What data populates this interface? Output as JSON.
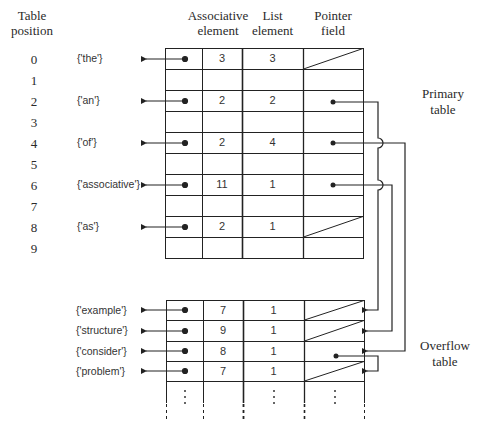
{
  "headers": {
    "table_position": [
      "Table",
      "position"
    ],
    "associative_element": [
      "Associative",
      "element"
    ],
    "list_element": [
      "List",
      "element"
    ],
    "pointer_field": [
      "Pointer",
      "field"
    ]
  },
  "labels": {
    "primary_table": [
      "Primary",
      "table"
    ],
    "overflow_table": [
      "Overflow",
      "table"
    ]
  },
  "primary_table": {
    "rows": [
      {
        "position": "0",
        "set": "{'the'}",
        "associative": "3",
        "list": "3",
        "pointer": "null"
      },
      {
        "position": "1",
        "set": "",
        "associative": "",
        "list": "",
        "pointer": ""
      },
      {
        "position": "2",
        "set": "{'an'}",
        "associative": "2",
        "list": "2",
        "pointer": "overflow-0"
      },
      {
        "position": "3",
        "set": "",
        "associative": "",
        "list": "",
        "pointer": ""
      },
      {
        "position": "4",
        "set": "{'of'}",
        "associative": "2",
        "list": "4",
        "pointer": "overflow-2"
      },
      {
        "position": "5",
        "set": "",
        "associative": "",
        "list": "",
        "pointer": ""
      },
      {
        "position": "6",
        "set": "{'associative'}",
        "associative": "11",
        "list": "1",
        "pointer": "overflow-1"
      },
      {
        "position": "7",
        "set": "",
        "associative": "",
        "list": "",
        "pointer": ""
      },
      {
        "position": "8",
        "set": "{'as'}",
        "associative": "2",
        "list": "1",
        "pointer": "null"
      },
      {
        "position": "9",
        "set": "",
        "associative": "",
        "list": "",
        "pointer": ""
      }
    ]
  },
  "overflow_table": {
    "rows": [
      {
        "set": "{'example'}",
        "associative": "7",
        "list": "1",
        "pointer": "null"
      },
      {
        "set": "{'structure'}",
        "associative": "9",
        "list": "1",
        "pointer": "null"
      },
      {
        "set": "{'consider'}",
        "associative": "8",
        "list": "1",
        "pointer": "overflow-3"
      },
      {
        "set": "{'problem'}",
        "associative": "7",
        "list": "1",
        "pointer": "null"
      }
    ],
    "continuation": "⋮"
  },
  "colors": {
    "line": "#222222",
    "text": "#2a2a2a"
  }
}
